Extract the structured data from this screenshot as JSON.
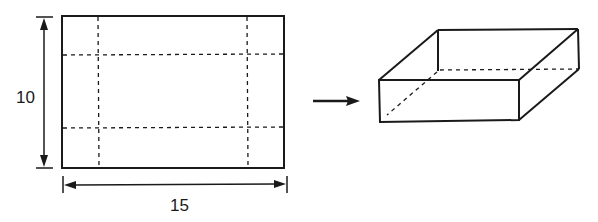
{
  "diagram": {
    "sheet": {
      "height_label": "10",
      "width_label": "15"
    },
    "arrow": "right-arrow",
    "result": "open-top-box"
  }
}
